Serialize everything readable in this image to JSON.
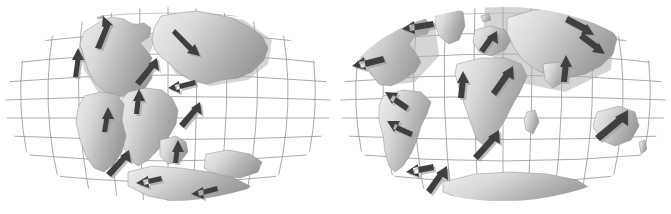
{
  "figure": {
    "title": "Continental drift: Pangaea breakup and present-day continents",
    "background_color": "#ffffff",
    "width": 671,
    "height": 214
  },
  "style": {
    "grid_color": "#9a948e",
    "land_stroke": "#8e8e8e",
    "land_fill_light": "#e8e8e8",
    "land_fill_dark": "#9d9d9d",
    "arrow_color": "#3f3f3f",
    "arrow_shadow_color": "#9e9e9e",
    "land_shadow_color": "#b0b0b0"
  },
  "panels": [
    {
      "id": "pangaea",
      "name": "Pangaea breakup globe",
      "caption": "",
      "projection": "oval globe graticule",
      "center": [
        168,
        104
      ],
      "radius_x": 162,
      "radius_y": 96,
      "meridian_count": 13,
      "parallel_count": 9,
      "landmasses": [
        {
          "name": "laurasia-north-america",
          "label": ""
        },
        {
          "name": "eurasia",
          "label": ""
        },
        {
          "name": "gondwana-africa",
          "label": ""
        },
        {
          "name": "gondwana-south-america",
          "label": ""
        },
        {
          "name": "india",
          "label": ""
        },
        {
          "name": "australia",
          "label": ""
        },
        {
          "name": "antarctica",
          "label": ""
        }
      ],
      "drift_arrows": [
        {
          "name": "arrow-na-northeast",
          "direction": "northeast"
        },
        {
          "name": "arrow-na-north",
          "direction": "north"
        },
        {
          "name": "arrow-eurasia-southeast",
          "direction": "southeast"
        },
        {
          "name": "arrow-eurasia-northeast",
          "direction": "northeast"
        },
        {
          "name": "arrow-eurasia-southwest",
          "direction": "southwest"
        },
        {
          "name": "arrow-africa-north",
          "direction": "north"
        },
        {
          "name": "arrow-africa-northeast",
          "direction": "northeast"
        },
        {
          "name": "arrow-south-america-north",
          "direction": "north"
        },
        {
          "name": "arrow-south-america-northeast",
          "direction": "northeast"
        },
        {
          "name": "arrow-india-north",
          "direction": "north"
        },
        {
          "name": "arrow-australia-west",
          "direction": "west"
        },
        {
          "name": "arrow-antarctica-west",
          "direction": "west"
        }
      ]
    },
    {
      "id": "present-day",
      "name": "Present-day globe",
      "caption": "",
      "projection": "oval globe graticule",
      "center": [
        168,
        104
      ],
      "radius_x": 162,
      "radius_y": 96,
      "meridian_count": 13,
      "parallel_count": 9,
      "landmasses": [
        {
          "name": "north-america",
          "label": ""
        },
        {
          "name": "greenland",
          "label": ""
        },
        {
          "name": "south-america",
          "label": ""
        },
        {
          "name": "africa",
          "label": ""
        },
        {
          "name": "europe",
          "label": ""
        },
        {
          "name": "asia",
          "label": ""
        },
        {
          "name": "india",
          "label": ""
        },
        {
          "name": "madagascar",
          "label": ""
        },
        {
          "name": "australia",
          "label": ""
        },
        {
          "name": "new-zealand",
          "label": ""
        },
        {
          "name": "antarctica",
          "label": ""
        }
      ],
      "drift_arrows": [
        {
          "name": "arrow-greenland-west",
          "direction": "west"
        },
        {
          "name": "arrow-north-america-west",
          "direction": "west"
        },
        {
          "name": "arrow-europe-northeast",
          "direction": "northeast"
        },
        {
          "name": "arrow-asia-southeast",
          "direction": "southeast"
        },
        {
          "name": "arrow-asia-southeast-2",
          "direction": "southeast"
        },
        {
          "name": "arrow-asia-north",
          "direction": "north"
        },
        {
          "name": "arrow-africa-north",
          "direction": "north"
        },
        {
          "name": "arrow-africa-northeast",
          "direction": "northeast"
        },
        {
          "name": "arrow-africa-south-northeast",
          "direction": "northeast"
        },
        {
          "name": "arrow-south-america-northwest",
          "direction": "northwest"
        },
        {
          "name": "arrow-south-america-west",
          "direction": "west"
        },
        {
          "name": "arrow-south-america-southwest",
          "direction": "west"
        },
        {
          "name": "arrow-antarctica-northeast",
          "direction": "northeast"
        },
        {
          "name": "arrow-australia-northeast",
          "direction": "northeast"
        }
      ]
    }
  ]
}
